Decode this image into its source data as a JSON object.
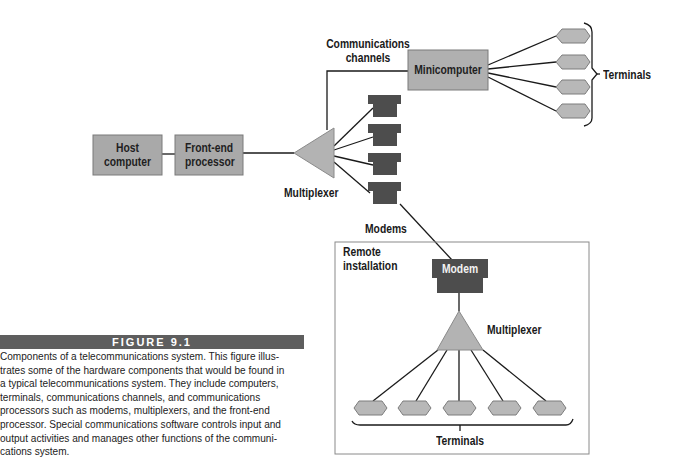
{
  "figure": {
    "label": "FIGURE 9.1",
    "caption": "Components of a telecommunications system. This figure illustrates some of the hardware components that would be found in a typical telecommunications system. They include computers, terminals, communications channels, and communications processors such as modems, multiplexers, and the front-end processor. Special communications software controls input and output activities and manages other functions of the communications system.",
    "caption_lines": [
      "Components of a telecommunications system. This figure illus-",
      "trates some of the hardware components that would be found in",
      "a typical telecommunications system. They include computers,",
      "terminals, communications channels, and communications",
      "processors such as modems, multiplexers, and the front-end",
      "processor. Special communications software controls input and",
      "output activities and manages other functions of the communi-",
      "cations system."
    ]
  },
  "nodes": {
    "host_computer": {
      "line1": "Host",
      "line2": "computer"
    },
    "front_end_processor": {
      "line1": "Front-end",
      "line2": "processor"
    },
    "multiplexer_main": "Multiplexer",
    "minicomputer": "Minicomputer",
    "modems": "Modems",
    "terminals_top": "Terminals",
    "remote_installation": {
      "line1": "Remote",
      "line2": "installation"
    },
    "remote_modem": "Modem",
    "multiplexer_remote": "Multiplexer",
    "terminals_bottom": "Terminals"
  },
  "edges_label": {
    "line1": "Communications",
    "line2": "channels"
  },
  "colors": {
    "box_fill": "#a9a9a9",
    "modem_fill": "#4d4d4d",
    "terminal_fill": "#b8b8b8",
    "caption_bar": "#5e5e5e",
    "line": "#1a1a1a"
  }
}
